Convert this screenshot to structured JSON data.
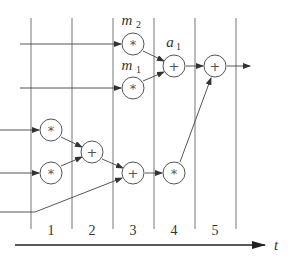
{
  "diagram": {
    "title": "",
    "time_axis": {
      "label": "t"
    },
    "columns": [
      {
        "label": "1"
      },
      {
        "label": "2"
      },
      {
        "label": "3"
      },
      {
        "label": "4"
      },
      {
        "label": "5"
      }
    ],
    "nodes": [
      {
        "id": "m2",
        "op": "*",
        "label": "m",
        "sub": "2"
      },
      {
        "id": "m1",
        "op": "*",
        "label": "m",
        "sub": "1"
      },
      {
        "id": "a1",
        "op": "+",
        "label": "a",
        "sub": "1"
      },
      {
        "id": "final_add",
        "op": "+"
      },
      {
        "id": "mul_c1_top",
        "op": "*"
      },
      {
        "id": "mul_c1_bottom",
        "op": "*"
      },
      {
        "id": "add_c2",
        "op": "+"
      },
      {
        "id": "add_c3",
        "op": "+"
      },
      {
        "id": "mul_c4",
        "op": "*"
      }
    ],
    "colors": {
      "line": "#555555",
      "text": "#333333",
      "background": "#ffffff"
    }
  }
}
